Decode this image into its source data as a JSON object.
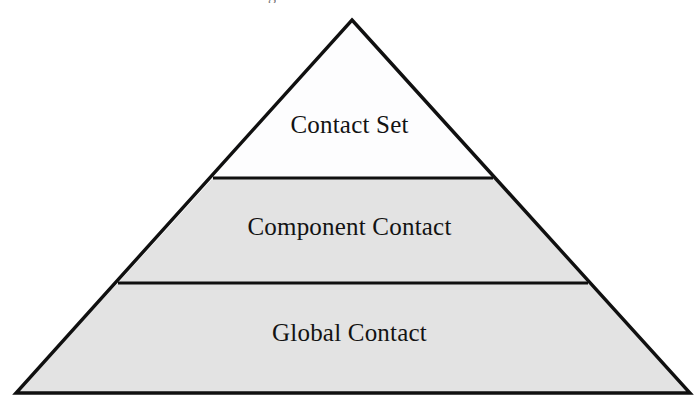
{
  "figure": {
    "type": "pyramid-diagram",
    "background_color": "#ffffff",
    "stroke_color": "#101010",
    "stroke_width_px": 3,
    "apex": {
      "x": 352,
      "y": 20
    },
    "base_left": {
      "x": 16,
      "y": 393
    },
    "base_right": {
      "x": 690,
      "y": 393
    },
    "dividers": [
      {
        "y": 178,
        "x_left": 213,
        "x_right": 493
      },
      {
        "y": 283,
        "x_left": 118,
        "x_right": 588
      }
    ],
    "tiers": [
      {
        "id": "tier-top",
        "label": "Contact Set",
        "fill_color": "#fdfdfe",
        "level": 1,
        "position": "top"
      },
      {
        "id": "tier-middle",
        "label": "Component Contact",
        "fill_color": "#e3e3e3",
        "level": 2,
        "position": "middle"
      },
      {
        "id": "tier-bottom",
        "label": "Global Contact",
        "fill_color": "#e3e3e3",
        "level": 3,
        "position": "bottom"
      }
    ],
    "caption_remnant": "g"
  }
}
